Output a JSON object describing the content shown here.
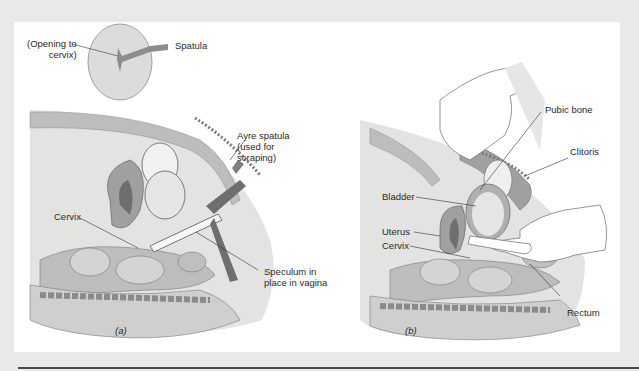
{
  "figure": {
    "panel_a": {
      "caption": "(a)",
      "inset_labels": {
        "opening": "(Opening to cervix)",
        "opening_line1": "(Opening to",
        "opening_line2": "cervix)",
        "spatula": "Spatula"
      },
      "labels": {
        "ayre_line1": "Ayre spatula",
        "ayre_line2": "(used for",
        "ayre_line3": "scraping)",
        "cervix": "Cervix",
        "speculum_line1": "Speculum in",
        "speculum_line2": "place in vagina"
      }
    },
    "panel_b": {
      "caption": "(b)",
      "labels": {
        "pubic_bone": "Pubic bone",
        "clitoris": "Clitoris",
        "bladder": "Bladder",
        "uterus": "Uterus",
        "cervix": "Cervix",
        "rectum": "Rectum"
      }
    }
  },
  "colors": {
    "page_bg": "#e9e9e7",
    "panel_bg": "#ffffff",
    "tissue_light": "#d9d9d6",
    "tissue_mid": "#a9a9a6",
    "tissue_dark": "#6e6e6c",
    "text": "#2a2a2a"
  }
}
